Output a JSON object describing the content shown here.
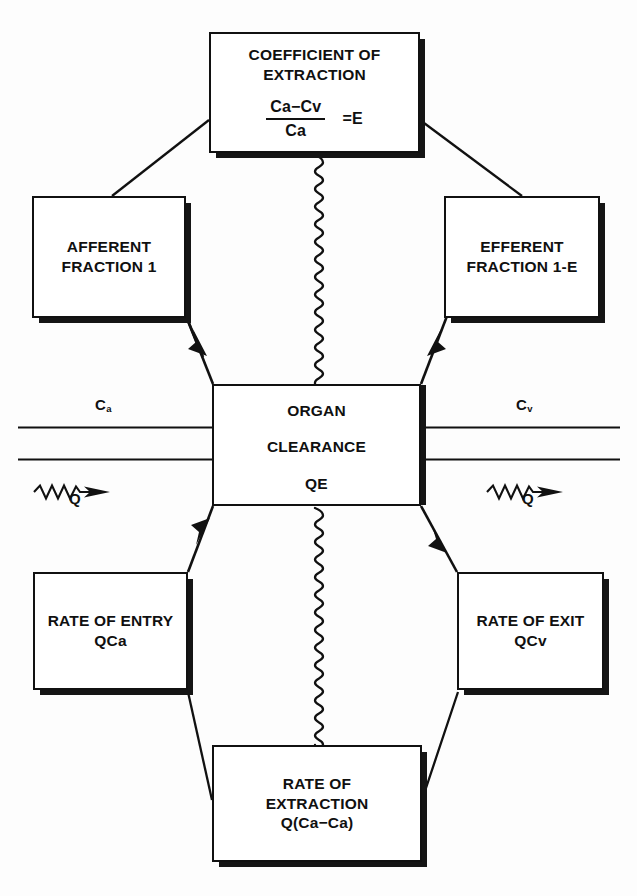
{
  "diagram": {
    "background_color": "#fdfdfd",
    "line_color": "#111111"
  },
  "nodes": {
    "coefficient": {
      "line1": "COEFFICIENT OF",
      "line2": "EXTRACTION",
      "formula_numerator": "Ca−Cv",
      "formula_denominator": "Ca",
      "formula_equals": "=E"
    },
    "afferent": {
      "line1": "AFFERENT",
      "line2": "FRACTION 1"
    },
    "efferent": {
      "line1": "EFFERENT",
      "line2": "FRACTION 1-E"
    },
    "organ": {
      "line1": "ORGAN",
      "line2": "CLEARANCE",
      "line3": "QE"
    },
    "rate_entry": {
      "line1": "RATE OF ENTRY",
      "line2": "QCa"
    },
    "rate_exit": {
      "line1": "RATE OF EXIT",
      "line2": "QCv"
    },
    "rate_extraction": {
      "line1": "RATE OF",
      "line2": "EXTRACTION",
      "line3": "Q(Ca−Ca)"
    }
  },
  "labels": {
    "arterial_concentration": "C",
    "arterial_subscript": "a",
    "venous_concentration": "C",
    "venous_subscript": "v",
    "flow_left": "Q",
    "flow_right": "Q"
  }
}
